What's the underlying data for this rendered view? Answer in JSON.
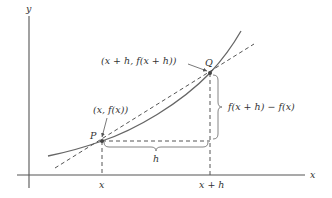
{
  "axes": {
    "x_label": "x",
    "y_label": "y"
  },
  "points": {
    "P": {
      "name": "P",
      "coord_label": "(x, f(x))"
    },
    "Q": {
      "name": "Q",
      "coord_label": "(x + h, f(x + h))"
    }
  },
  "ticks": {
    "x": "x",
    "x_plus_h": "x + h"
  },
  "measures": {
    "horizontal": "h",
    "vertical": "f(x + h) − f(x)"
  },
  "colors": {
    "axis": "#555555",
    "curve": "#666666",
    "dashed": "#555555",
    "text": "#333333"
  }
}
